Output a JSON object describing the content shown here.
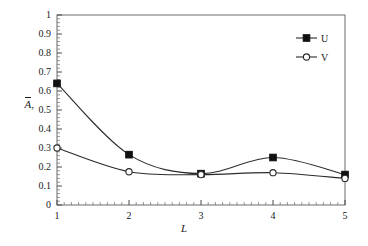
{
  "chart_data": {
    "type": "line",
    "title": "",
    "xlabel": "L",
    "ylabel": "Ā,",
    "x": [
      1,
      2,
      3,
      4,
      5
    ],
    "xlim": [
      1,
      5
    ],
    "ylim": [
      0,
      1
    ],
    "grid": false,
    "legend_position": "top-right",
    "xticks": [
      "1",
      "2",
      "3",
      "4",
      "5"
    ],
    "yticks": [
      "0",
      "0.1",
      "0.2",
      "0.3",
      "0.4",
      "0.5",
      "0.6",
      "0.7",
      "0.8",
      "0.9",
      "1"
    ],
    "ytick_values": [
      0,
      0.1,
      0.2,
      0.3,
      0.4,
      0.5,
      0.6,
      0.7,
      0.8,
      0.9,
      1
    ],
    "minor_ticks": true,
    "series": [
      {
        "name": "U",
        "marker": "filled-square",
        "values": [
          0.64,
          0.265,
          0.165,
          0.25,
          0.16
        ]
      },
      {
        "name": "V",
        "marker": "open-circle",
        "values": [
          0.3,
          0.175,
          0.16,
          0.17,
          0.14
        ]
      }
    ]
  },
  "axes": {
    "y_label_text": "A",
    "y_label_subscript": ",",
    "x_label_text": "L"
  },
  "legend": {
    "entries": [
      {
        "label": "U",
        "marker": "filled-square-marker"
      },
      {
        "label": "V",
        "marker": "open-circle-marker"
      }
    ]
  },
  "colors": {
    "line": "#2b2b2b",
    "frame": "#555555",
    "marker_fill": "#111111",
    "marker_open_fill": "#ffffff",
    "text": "#1a1a1a",
    "background": "#ffffff"
  }
}
